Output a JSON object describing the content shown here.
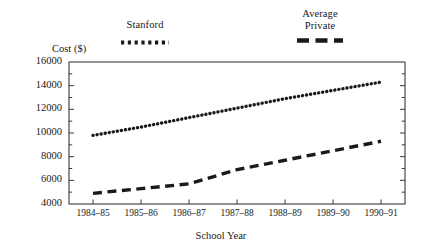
{
  "chart_data": {
    "type": "line",
    "title": "",
    "xlabel": "School Year",
    "ylabel": "Cost ($)",
    "categories": [
      "1984–85",
      "1985–86",
      "1986–87",
      "1987–88",
      "1988–89",
      "1989–90",
      "1990–91"
    ],
    "ylim": [
      4000,
      16000
    ],
    "ytick_labels": [
      "4000",
      "6000",
      "8000",
      "10000",
      "12000",
      "14000",
      "16000"
    ],
    "ytick_values": [
      4000,
      6000,
      8000,
      10000,
      12000,
      14000,
      16000
    ],
    "yminor_step": 1000,
    "grid": false,
    "legend_position": "above-plot",
    "series": [
      {
        "name": "Stanford",
        "style": "dotted",
        "color": "#1a1a1a",
        "values": [
          9800,
          10500,
          11300,
          12100,
          12900,
          13600,
          14300
        ]
      },
      {
        "name": "Average\nPrivate",
        "style": "dashed",
        "color": "#1a1a1a",
        "values": [
          4900,
          5300,
          5700,
          6900,
          7700,
          8500,
          9300
        ]
      }
    ]
  },
  "legend": {
    "stanford": "Stanford",
    "private": "Average\nPrivate"
  },
  "axes": {
    "y_title": "Cost ($)",
    "x_title": "School Year"
  }
}
